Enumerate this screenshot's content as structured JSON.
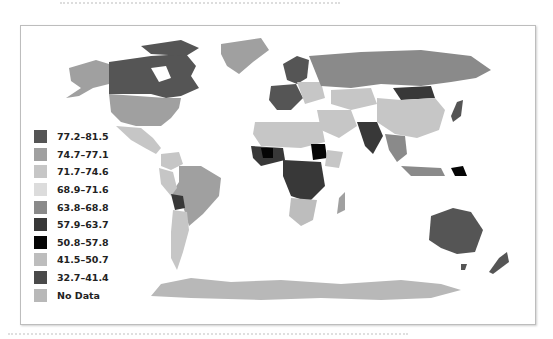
{
  "figure": {
    "top_caption": "",
    "bottom_caption": ""
  },
  "map": {
    "type": "choropleth world map",
    "colors": {
      "c1": "#555555",
      "c2": "#a0a0a0",
      "c3": "#c6c6c6",
      "c4": "#dcdcdc",
      "c5": "#8a8a8a",
      "c6": "#383838",
      "c7": "#050505",
      "c8": "#bdbdbd",
      "c9": "#4a4a4a",
      "nodata": "#b8b8b8"
    }
  },
  "legend": {
    "items": [
      {
        "label": "77.2–81.5",
        "color": "#555555"
      },
      {
        "label": "74.7–77.1",
        "color": "#a0a0a0"
      },
      {
        "label": "71.7–74.6",
        "color": "#c6c6c6"
      },
      {
        "label": "68.9–71.6",
        "color": "#dcdcdc"
      },
      {
        "label": "63.8–68.8",
        "color": "#8a8a8a"
      },
      {
        "label": "57.9–63.7",
        "color": "#383838"
      },
      {
        "label": "50.8–57.8",
        "color": "#050505"
      },
      {
        "label": "41.5–50.7",
        "color": "#bdbdbd"
      },
      {
        "label": "32.7–41.4",
        "color": "#4a4a4a"
      },
      {
        "label": "No Data",
        "color": "#b8b8b8"
      }
    ]
  }
}
